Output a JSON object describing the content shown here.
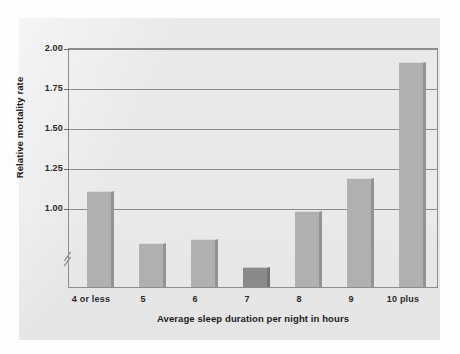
{
  "chart_data": {
    "type": "bar",
    "title": "",
    "subtitle": "",
    "xlabel": "Average sleep duration per night in hours",
    "ylabel": "Relative mortality rate",
    "categories": [
      "4 or less",
      "5",
      "6",
      "7",
      "8",
      "9",
      "10 plus"
    ],
    "values": [
      1.34,
      1.1,
      1.12,
      0.99,
      1.25,
      1.4,
      1.93
    ],
    "ylim": [
      0.9,
      2.0
    ],
    "yticks": [
      1.0,
      1.25,
      1.5,
      1.75,
      2.0
    ],
    "ytick_labels": [
      "1.00",
      "1.25",
      "1.50",
      "1.75",
      "2.00"
    ],
    "grid": true,
    "axis_break": true,
    "legend": null,
    "legend_position": "none",
    "series": [
      {
        "name": "Relative mortality rate",
        "values": [
          1.34,
          1.1,
          1.12,
          0.99,
          1.25,
          1.4,
          1.93
        ]
      }
    ],
    "highlight_index": 3,
    "colors": {
      "bar": "#b0b0b0",
      "bar_highlight": "#8a8a8a",
      "grid": "#8d8d8d",
      "axis": "#8d8d8d",
      "panel_background": "#e9e9e9",
      "figure_background": "#fdfdfd",
      "text": "#1c1c1c"
    }
  }
}
